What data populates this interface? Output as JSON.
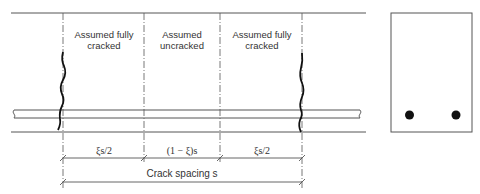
{
  "diagram": {
    "regions": [
      {
        "label_line1": "Assumed fully",
        "label_line2": "cracked"
      },
      {
        "label_line1": "Assumed",
        "label_line2": "uncracked"
      },
      {
        "label_line1": "Assumed fully",
        "label_line2": "cracked"
      }
    ],
    "dimensions": {
      "segment1": "ξs/2",
      "segment2": "(1 − ξ)s",
      "segment3": "ξs/2",
      "total": "Crack spacing s"
    },
    "cross_section": {
      "bars": 2
    },
    "colors": {
      "line": "#555555",
      "crack": "#111111",
      "bar_dot": "#111111"
    }
  }
}
